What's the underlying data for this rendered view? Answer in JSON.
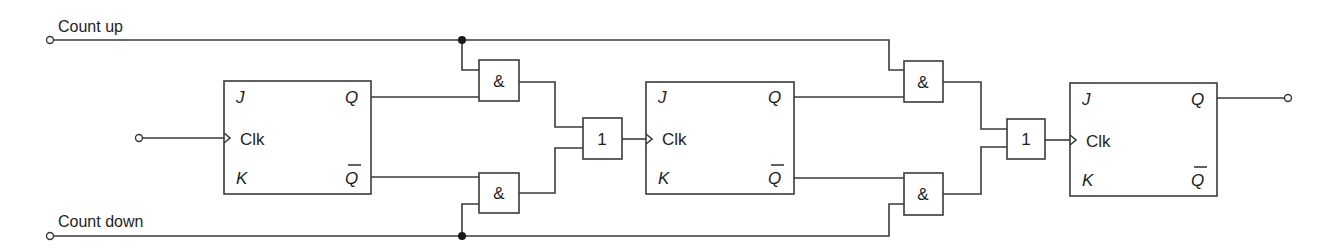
{
  "diagram": {
    "type": "synchronous up/down counter logic (JK flip-flops)",
    "inputs": {
      "count_up": "Count up",
      "count_down": "Count down"
    },
    "flip_flops": [
      {
        "id": "ff1",
        "pins": {
          "j": "J",
          "clk": "Clk",
          "k": "K",
          "q": "Q",
          "qbar": "Q"
        }
      },
      {
        "id": "ff2",
        "pins": {
          "j": "J",
          "clk": "Clk",
          "k": "K",
          "q": "Q",
          "qbar": "Q"
        }
      },
      {
        "id": "ff3",
        "pins": {
          "j": "J",
          "clk": "Clk",
          "k": "K",
          "q": "Q",
          "qbar": "Q"
        }
      }
    ],
    "gates": {
      "and_symbol": "&",
      "or_symbol": "1",
      "stage1": {
        "and_up": "&",
        "and_down": "&",
        "or": "1"
      },
      "stage2": {
        "and_up": "&",
        "and_down": "&",
        "or": "1"
      }
    },
    "colors": {
      "line": "#3a3a3a",
      "text": "#1e1e1e",
      "background": "#ffffff"
    }
  }
}
